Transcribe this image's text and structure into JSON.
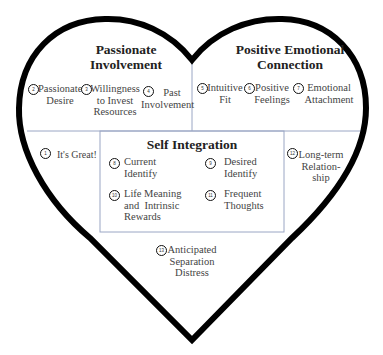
{
  "diagram": {
    "shape": "heart",
    "colors": {
      "outline": "#000000",
      "divider": "#9aa6c4",
      "text": "#444444",
      "heading": "#222222"
    },
    "sections": {
      "passionate_involvement": {
        "title_line1": "Passionate",
        "title_line2": "Involvement",
        "items": [
          {
            "num": "2",
            "line1": "Passionate",
            "line2": "Desire"
          },
          {
            "num": "3",
            "line1": "Willingness",
            "line2": "to Invest",
            "line3": "Resources"
          },
          {
            "num": "4",
            "line1": "Past",
            "line2": "Involvement"
          }
        ]
      },
      "positive_emotional_connection": {
        "title_line1": "Positive Emotional",
        "title_line2": "Connection",
        "items": [
          {
            "num": "5",
            "line1": "Intuitive",
            "line2": "Fit"
          },
          {
            "num": "6",
            "line1": "Positive",
            "line2": "Feelings"
          },
          {
            "num": "7",
            "line1": "Emotional",
            "line2": "Attachment"
          }
        ]
      },
      "its_great": {
        "num": "1",
        "label": "It's Great!"
      },
      "self_integration": {
        "title": "Self Integration",
        "items": [
          {
            "num": "8",
            "line1": "Current",
            "line2": "Identify"
          },
          {
            "num": "9",
            "line1": "Desired",
            "line2": "Identify"
          },
          {
            "num": "10",
            "line1": "Life Meaning",
            "line2": "and  Intrinsic",
            "line3": "Rewards"
          },
          {
            "num": "11",
            "line1": "Frequent",
            "line2": "Thoughts"
          }
        ]
      },
      "long_term_relationship": {
        "num": "12",
        "line1": "Long-term",
        "line2": "Relation-",
        "line3": "ship"
      },
      "anticipated_separation_distress": {
        "num": "13",
        "line1": "Anticipated",
        "line2": "Separation",
        "line3": "Distress"
      }
    }
  }
}
